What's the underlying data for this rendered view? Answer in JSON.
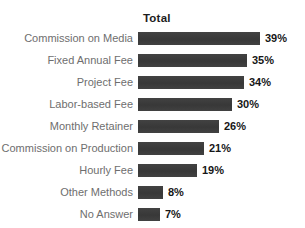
{
  "title": "Total",
  "chart_data": {
    "type": "bar",
    "orientation": "horizontal",
    "title": "Total",
    "categories": [
      "Commission on Media",
      "Fixed Annual Fee",
      "Project Fee",
      "Labor-based Fee",
      "Monthly Retainer",
      "Commission on Production",
      "Hourly Fee",
      "Other Methods",
      "No Answer"
    ],
    "values": [
      39,
      35,
      34,
      30,
      26,
      21,
      19,
      8,
      7
    ],
    "value_labels": [
      "39%",
      "35%",
      "34%",
      "30%",
      "26%",
      "21%",
      "19%",
      "8%",
      "7%"
    ],
    "xlabel": "",
    "ylabel": "",
    "xlim": [
      0,
      40
    ],
    "grid": false,
    "legend": "none",
    "bar_color": "#3d3d3d",
    "category_label_color": "#6e6e6e",
    "value_label_color": "#161616"
  }
}
